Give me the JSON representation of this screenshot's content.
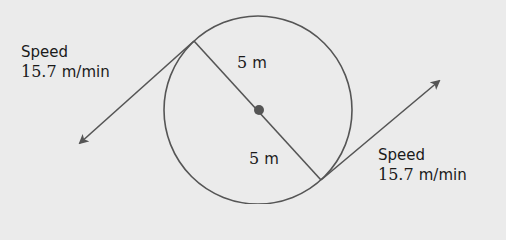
{
  "diagram": {
    "colors": {
      "background": "#ebebeb",
      "stroke": "#555555",
      "text": "#1a1a1a"
    },
    "circle": {
      "cx": 258,
      "cy": 110,
      "r": 94
    },
    "center_dot": {
      "cx": 259,
      "cy": 110,
      "r": 5
    },
    "diameter": {
      "x1": 194,
      "y1": 41,
      "x2": 321,
      "y2": 180
    },
    "radius_labels": [
      {
        "value": "5",
        "unit": "m"
      },
      {
        "value": "5",
        "unit": "m"
      }
    ],
    "tangents": [
      {
        "name": "left",
        "from": [
          194,
          41
        ],
        "to": [
          80,
          143
        ],
        "label_word": "Speed",
        "label_value": "15.7",
        "label_unit": "m/min"
      },
      {
        "name": "right",
        "from": [
          321,
          180
        ],
        "to": [
          439,
          81
        ],
        "label_word": "Speed",
        "label_value": "15.7",
        "label_unit": "m/min"
      }
    ]
  }
}
